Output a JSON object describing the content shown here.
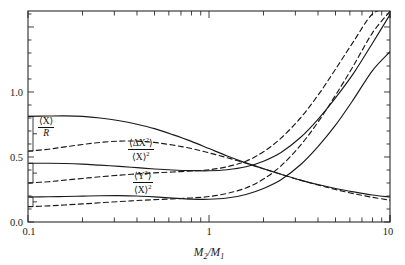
{
  "chart_data": {
    "type": "line",
    "title": "",
    "xlabel": "M2/M1",
    "ylabel": "",
    "xscale": "log",
    "xlim": [
      0.1,
      10
    ],
    "ylim": [
      0.0,
      1.623
    ],
    "grid": false,
    "legend_position": "inline-left",
    "xtick_labels": [
      "0.1",
      "1",
      "10"
    ],
    "xtick_values": [
      0.1,
      1,
      10
    ],
    "ytick_labels": [
      "0.0",
      "0.5",
      "1.0"
    ],
    "ytick_values": [
      0.0,
      0.5,
      1.0
    ],
    "x": [
      0.1,
      0.13,
      0.16,
      0.2,
      0.25,
      0.32,
      0.4,
      0.5,
      0.63,
      0.8,
      1.0,
      1.26,
      1.6,
      2.0,
      2.5,
      3.2,
      4.0,
      5.0,
      6.3,
      8.0,
      10.0
    ],
    "series": [
      {
        "name": "<X>/R solid upper",
        "style": "solid",
        "label_group": "ratio_X_over_R",
        "values": [
          0.812,
          0.815,
          0.816,
          0.812,
          0.8,
          0.779,
          0.752,
          0.718,
          0.672,
          0.62,
          0.565,
          0.508,
          0.455,
          0.41,
          0.367,
          0.322,
          0.288,
          0.258,
          0.232,
          0.208,
          0.192
        ]
      },
      {
        "name": "<X>/R dashed lower",
        "style": "dashed",
        "label_group": "ratio_X_over_R",
        "values": [
          0.545,
          0.56,
          0.578,
          0.596,
          0.612,
          0.622,
          0.622,
          0.612,
          0.592,
          0.565,
          0.532,
          0.494,
          0.452,
          0.41,
          0.367,
          0.322,
          0.285,
          0.25,
          0.218,
          0.19,
          0.168
        ]
      },
      {
        "name": "<dX^2>/<X>^2 solid",
        "style": "solid",
        "label_group": "ratio_dX2_over_X2",
        "values": [
          0.452,
          0.452,
          0.45,
          0.445,
          0.437,
          0.428,
          0.418,
          0.408,
          0.4,
          0.395,
          0.394,
          0.402,
          0.425,
          0.468,
          0.535,
          0.65,
          0.79,
          0.955,
          1.145,
          1.375,
          1.595
        ]
      },
      {
        "name": "<dX^2>/<X>^2 dashed",
        "style": "dashed",
        "label_group": "ratio_dX2_over_X2",
        "values": [
          0.3,
          0.31,
          0.322,
          0.335,
          0.348,
          0.36,
          0.37,
          0.378,
          0.385,
          0.392,
          0.402,
          0.425,
          0.468,
          0.54,
          0.645,
          0.8,
          0.975,
          1.175,
          1.39,
          1.6,
          1.64
        ]
      },
      {
        "name": "<Y^2>/<X>^2 solid",
        "style": "solid",
        "label_group": "ratio_Y2_over_X2",
        "values": [
          0.192,
          0.194,
          0.196,
          0.199,
          0.202,
          0.203,
          0.2,
          0.193,
          0.184,
          0.176,
          0.175,
          0.185,
          0.212,
          0.258,
          0.325,
          0.44,
          0.58,
          0.745,
          0.945,
          1.165,
          1.31
        ]
      },
      {
        "name": "<Y^2>/<X>^2 dashed",
        "style": "dashed",
        "label_group": "ratio_Y2_over_X2",
        "values": [
          0.118,
          0.124,
          0.131,
          0.139,
          0.148,
          0.157,
          0.165,
          0.172,
          0.178,
          0.185,
          0.196,
          0.22,
          0.262,
          0.33,
          0.432,
          0.59,
          0.768,
          0.975,
          1.205,
          1.455,
          1.62
        ]
      }
    ],
    "annotations": [
      {
        "id": "ratio_X_over_R",
        "numerator": "⟨X⟩",
        "denominator": "R",
        "x_px": 38,
        "y_px": 117
      },
      {
        "id": "ratio_dX2_over_X2",
        "numerator": "⟨ΔX²⟩",
        "denominator": "⟨X⟩²",
        "x_px": 128,
        "y_px": 137
      },
      {
        "id": "ratio_Y2_over_X2",
        "numerator": "⟨Y²⟩",
        "denominator": "⟨X⟩²",
        "x_px": 133,
        "y_px": 170
      }
    ]
  },
  "axis": {
    "x_label_main": "M",
    "x_label_sub1": "2",
    "x_label_slash": "/",
    "x_label_main2": "M",
    "x_label_sub2": "1",
    "xticks": [
      "0.1",
      "1",
      "10"
    ],
    "yticks": [
      "0.0",
      "0.5",
      "1.0"
    ]
  },
  "labels": {
    "l1_num": "⟨X⟩",
    "l1_den": "R",
    "l2_num_open": "⟨ΔX",
    "l2_num_sup": "2",
    "l2_num_close": "⟩",
    "l2_den_open": "⟨X⟩",
    "l2_den_sup": "2",
    "l3_num_open": "⟨Y",
    "l3_num_sup": "2",
    "l3_num_close": "⟩",
    "l3_den_open": "⟨X⟩",
    "l3_den_sup": "2"
  },
  "style": {
    "line_color": "#1a1a1a",
    "frame_color": "#2a2a2a",
    "background": "#ffffff"
  }
}
